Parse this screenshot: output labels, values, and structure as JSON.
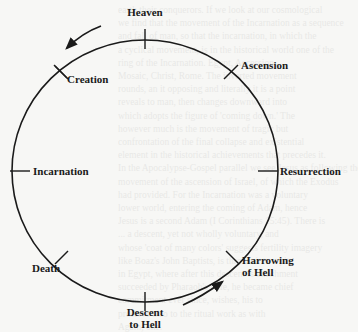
{
  "diagram": {
    "type": "cycle",
    "direction": "counterclockwise",
    "stages": [
      {
        "id": "heaven",
        "label": "Heaven"
      },
      {
        "id": "creation",
        "label": "Creation"
      },
      {
        "id": "incarnation",
        "label": "Incarnation"
      },
      {
        "id": "death",
        "label": "Death"
      },
      {
        "id": "descent",
        "label_line1": "Descent",
        "label_line2": "to Hell"
      },
      {
        "id": "harrowing",
        "label_line1": "Harrowing",
        "label_line2": "of Hell"
      },
      {
        "id": "resurrection",
        "label": "Resurrection"
      },
      {
        "id": "ascension",
        "label": "Ascension"
      }
    ],
    "arrows": [
      {
        "position": "top-left",
        "points": "from Heaven toward Creation"
      },
      {
        "position": "bottom-right",
        "points": "from Descent to Hell toward Harrowing of Hell"
      }
    ],
    "colors": {
      "ink": "#1a1a1a",
      "paper": "#f7f7f5"
    }
  },
  "background_bleed": {
    "lines": [
      "earth their conquerors. If we look at our cosmological",
      "we find that the movement of the Incarnation as a sequence",
      "and fall of man, so that the incarnation, in which the",
      "a cyclical movement, is in the historical world one of the",
      "ring of the Incarnation. Egypt, Accession,",
      "Mosaic, Christ, Rome. The inverted movement",
      "rounds, an it opposing and literally it is a point",
      "reveals to man, then changes downward into",
      "which adopts the figure of 'coming down.' The",
      "however much is the movement of tragic but",
      "confrontation of the final collapse and existential",
      "element in the historical achievements that precedes it.",
      "In the Apocalypse-Gospel parallel we see Jesus as following the",
      "movement of the ascension of Israel, of which the Exodus",
      "had provided. For the Incarnation was a voluntary",
      "lower world, entering the coming of Adam, hence",
      "Jesus is a second Adam (I Corinthians 15:45). There is",
      "... a descent, yet not wholly voluntary, and",
      "whose 'coat of many colors' suggests fertility imagery",
      "like Boaz's John Baptists, is thrown into a pit",
      "in Egypt, where after this descent is attachment",
      "succeeded by Pharaoh's wife, he became chief",
      "commitment ever since, wishes, his to",
      "preserve also to the ritual work as with",
      "Again, one."
    ]
  }
}
